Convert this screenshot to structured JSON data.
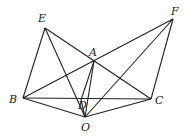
{
  "figure": {
    "points": {
      "A": [
        94,
        61
      ],
      "B": [
        23,
        98
      ],
      "C": [
        151,
        99
      ],
      "D": [
        81,
        100
      ],
      "E": [
        45,
        28
      ],
      "F": [
        173,
        19
      ],
      "O": [
        85,
        117
      ]
    },
    "segments": [
      [
        "E",
        "B"
      ],
      [
        "E",
        "O"
      ],
      [
        "E",
        "C"
      ],
      [
        "B",
        "F"
      ],
      [
        "B",
        "C"
      ],
      [
        "B",
        "O"
      ],
      [
        "O",
        "C"
      ],
      [
        "O",
        "F"
      ],
      [
        "F",
        "C"
      ],
      [
        "A",
        "O"
      ],
      [
        "A",
        "D"
      ],
      [
        "D",
        "O"
      ]
    ],
    "labels": {
      "E": {
        "text": "E",
        "x": 38,
        "y": 12
      },
      "F": {
        "text": "F",
        "x": 171,
        "y": 5
      },
      "A": {
        "text": "A",
        "x": 89,
        "y": 46
      },
      "B": {
        "text": "B",
        "x": 9,
        "y": 93
      },
      "C": {
        "text": "C",
        "x": 155,
        "y": 94
      },
      "D": {
        "text": "D",
        "x": 78,
        "y": 99
      },
      "O": {
        "text": "O",
        "x": 81,
        "y": 121
      }
    }
  }
}
